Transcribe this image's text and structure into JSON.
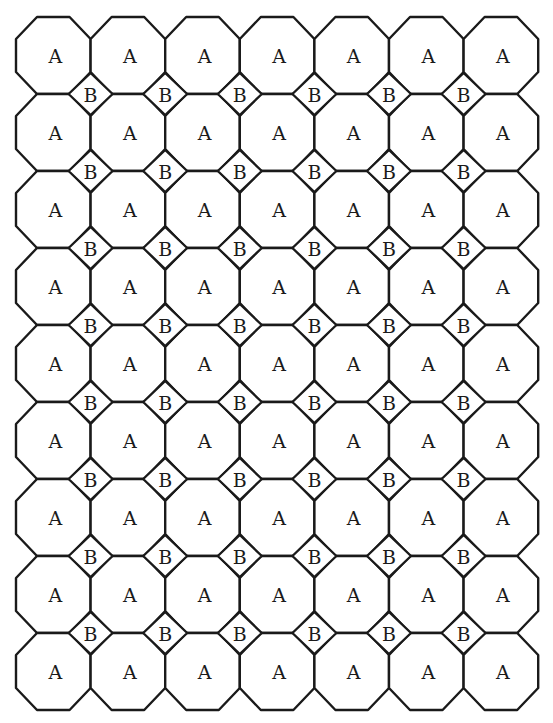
{
  "diagram": {
    "title": "",
    "grid": {
      "columns": 7,
      "rows": 9,
      "origin_x": 16,
      "origin_y": 17,
      "cell_width": 74.6,
      "cell_height": 77,
      "octagon_cut_x": 21,
      "octagon_cut_y": 22,
      "diamond_half_width": 22,
      "diamond_half_height": 21
    },
    "octagon_label": "A",
    "diamond_label": "B",
    "octagon_count": 63,
    "diamond_count": 48,
    "colors": {
      "stroke": "#1a1a1a",
      "fill": "#ffffff",
      "background": "#ffffff"
    }
  }
}
